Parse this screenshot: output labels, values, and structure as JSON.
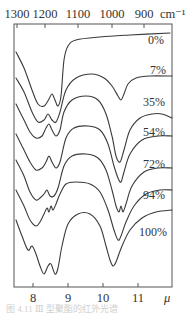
{
  "chart_data": {
    "type": "line",
    "title": "",
    "xlabel_bottom": "μ",
    "xlabel_top": "cm⁻¹",
    "ylabel": "",
    "bottom_axis": {
      "unit": "μ",
      "ticks": [
        {
          "label": "8",
          "value": 8
        },
        {
          "label": "9",
          "value": 9
        },
        {
          "label": "10",
          "value": 10
        },
        {
          "label": "11",
          "value": 11
        }
      ],
      "range": [
        7.5,
        11.9
      ]
    },
    "top_axis": {
      "unit": "cm⁻¹",
      "ticks": [
        {
          "label": "1300",
          "value": 1300
        },
        {
          "label": "1200",
          "value": 1200
        },
        {
          "label": "1100",
          "value": 1100
        },
        {
          "label": "1000",
          "value": 1000
        },
        {
          "label": "900",
          "value": 900
        }
      ]
    },
    "grid": false,
    "legend": "inline labels at right of each curve",
    "series": [
      {
        "name": "0%",
        "label": "0%",
        "points": [
          [
            16,
            52
          ],
          [
            24,
            68
          ],
          [
            32,
            90
          ],
          [
            38,
            104
          ],
          [
            44,
            106
          ],
          [
            49,
            99
          ],
          [
            52,
            94
          ],
          [
            55,
            100
          ],
          [
            58,
            106
          ],
          [
            61,
            96
          ],
          [
            64,
            60
          ],
          [
            68,
            46
          ],
          [
            76,
            40
          ],
          [
            100,
            37
          ],
          [
            130,
            35
          ],
          [
            170,
            33
          ]
        ]
      },
      {
        "name": "7%",
        "label": "7%",
        "points": [
          [
            16,
            78
          ],
          [
            24,
            92
          ],
          [
            32,
            112
          ],
          [
            38,
            122
          ],
          [
            44,
            120
          ],
          [
            48,
            114
          ],
          [
            52,
            120
          ],
          [
            56,
            122
          ],
          [
            60,
            112
          ],
          [
            66,
            90
          ],
          [
            76,
            78
          ],
          [
            92,
            74
          ],
          [
            104,
            78
          ],
          [
            112,
            86
          ],
          [
            118,
            96
          ],
          [
            121,
            100
          ],
          [
            124,
            94
          ],
          [
            128,
            84
          ],
          [
            136,
            78
          ],
          [
            150,
            76
          ],
          [
            172,
            76
          ]
        ]
      },
      {
        "name": "35%",
        "label": "35%",
        "points": [
          [
            16,
            104
          ],
          [
            24,
            120
          ],
          [
            30,
            132
          ],
          [
            36,
            138
          ],
          [
            42,
            136
          ],
          [
            46,
            128
          ],
          [
            49,
            124
          ],
          [
            52,
            130
          ],
          [
            56,
            136
          ],
          [
            60,
            130
          ],
          [
            64,
            112
          ],
          [
            72,
            100
          ],
          [
            86,
            96
          ],
          [
            98,
            100
          ],
          [
            106,
            114
          ],
          [
            112,
            136
          ],
          [
            116,
            156
          ],
          [
            120,
            162
          ],
          [
            124,
            150
          ],
          [
            130,
            130
          ],
          [
            140,
            118
          ],
          [
            152,
            114
          ],
          [
            162,
            114
          ],
          [
            172,
            118
          ]
        ]
      },
      {
        "name": "54%",
        "label": "54%",
        "points": [
          [
            16,
            134
          ],
          [
            24,
            150
          ],
          [
            30,
            162
          ],
          [
            36,
            170
          ],
          [
            42,
            168
          ],
          [
            46,
            162
          ],
          [
            49,
            156
          ],
          [
            52,
            162
          ],
          [
            56,
            168
          ],
          [
            60,
            162
          ],
          [
            66,
            138
          ],
          [
            74,
            128
          ],
          [
            88,
            126
          ],
          [
            100,
            130
          ],
          [
            108,
            144
          ],
          [
            114,
            166
          ],
          [
            118,
            178
          ],
          [
            121,
            182
          ],
          [
            124,
            172
          ],
          [
            130,
            154
          ],
          [
            142,
            140
          ],
          [
            158,
            136
          ],
          [
            172,
            136
          ]
        ]
      },
      {
        "name": "72%",
        "label": "72%",
        "points": [
          [
            16,
            160
          ],
          [
            24,
            176
          ],
          [
            30,
            192
          ],
          [
            36,
            200
          ],
          [
            40,
            198
          ],
          [
            44,
            194
          ],
          [
            47,
            190
          ],
          [
            50,
            196
          ],
          [
            54,
            196
          ],
          [
            58,
            188
          ],
          [
            64,
            166
          ],
          [
            72,
            156
          ],
          [
            86,
            154
          ],
          [
            98,
            158
          ],
          [
            106,
            170
          ],
          [
            112,
            190
          ],
          [
            116,
            206
          ],
          [
            119,
            212
          ],
          [
            121,
            206
          ],
          [
            123,
            212
          ],
          [
            126,
            204
          ],
          [
            132,
            186
          ],
          [
            144,
            172
          ],
          [
            158,
            168
          ],
          [
            172,
            168
          ]
        ]
      },
      {
        "name": "94%",
        "label": "94%",
        "points": [
          [
            16,
            190
          ],
          [
            24,
            206
          ],
          [
            30,
            220
          ],
          [
            36,
            226
          ],
          [
            40,
            222
          ],
          [
            44,
            214
          ],
          [
            47,
            208
          ],
          [
            49,
            212
          ],
          [
            51,
            206
          ],
          [
            53,
            210
          ],
          [
            56,
            204
          ],
          [
            60,
            194
          ],
          [
            66,
            184
          ],
          [
            76,
            182
          ],
          [
            90,
            184
          ],
          [
            100,
            192
          ],
          [
            108,
            210
          ],
          [
            114,
            230
          ],
          [
            118,
            240
          ],
          [
            121,
            236
          ],
          [
            126,
            222
          ],
          [
            134,
            206
          ],
          [
            146,
            194
          ],
          [
            160,
            190
          ],
          [
            172,
            190
          ]
        ]
      },
      {
        "name": "100%",
        "label": "100%",
        "points": [
          [
            16,
            220
          ],
          [
            22,
            236
          ],
          [
            28,
            250
          ],
          [
            32,
            246
          ],
          [
            36,
            254
          ],
          [
            40,
            266
          ],
          [
            44,
            274
          ],
          [
            48,
            266
          ],
          [
            51,
            264
          ],
          [
            55,
            274
          ],
          [
            58,
            268
          ],
          [
            62,
            246
          ],
          [
            68,
            224
          ],
          [
            78,
            214
          ],
          [
            90,
            214
          ],
          [
            100,
            226
          ],
          [
            106,
            246
          ],
          [
            110,
            260
          ],
          [
            113,
            266
          ],
          [
            116,
            262
          ],
          [
            122,
            246
          ],
          [
            130,
            230
          ],
          [
            142,
            218
          ],
          [
            156,
            212
          ],
          [
            172,
            210
          ]
        ]
      }
    ],
    "label_positions": [
      {
        "label": "0%",
        "x": 148,
        "y": 44
      },
      {
        "label": "7%",
        "x": 150,
        "y": 74
      },
      {
        "label": "35%",
        "x": 143,
        "y": 106
      },
      {
        "label": "54%",
        "x": 143,
        "y": 136
      },
      {
        "label": "72%",
        "x": 143,
        "y": 168
      },
      {
        "label": "94%",
        "x": 143,
        "y": 199
      },
      {
        "label": "100%",
        "x": 139,
        "y": 236
      }
    ],
    "frame": {
      "left": 14,
      "right": 172,
      "top": 24,
      "bottom": 287
    },
    "bottom_tick_px": [
      33,
      68,
      103,
      138
    ],
    "top_tick_px": [
      17,
      45,
      78,
      112,
      144
    ],
    "bottom_unit_px": 164,
    "top_unit_px": 160
  },
  "caption": "图 4.11 Ⅲ 型聚酯的红外光谱"
}
